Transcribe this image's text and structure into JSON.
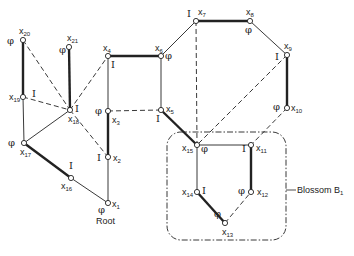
{
  "diagram": {
    "type": "graph-with-blossom",
    "nodes": [
      {
        "id": "x1",
        "label": "x",
        "sub": "1",
        "x": 108,
        "y": 203,
        "mark": "φ",
        "mx": -10,
        "my": 10,
        "lx": 4,
        "ly": 4
      },
      {
        "id": "x2",
        "label": "x",
        "sub": "2",
        "x": 108,
        "y": 157,
        "mark": "I",
        "mx": -11,
        "my": 4,
        "lx": 5,
        "ly": 4
      },
      {
        "id": "x3",
        "label": "x",
        "sub": "3",
        "x": 108,
        "y": 111,
        "mark": "φ",
        "mx": -13,
        "my": 3,
        "lx": 4,
        "ly": 12
      },
      {
        "id": "x4",
        "label": "x",
        "sub": "4",
        "x": 108,
        "y": 56,
        "mark": "I",
        "mx": 3,
        "my": 12,
        "lx": -5,
        "ly": -5
      },
      {
        "id": "x5",
        "label": "x",
        "sub": "5",
        "x": 161,
        "y": 110,
        "mark": "I",
        "mx": -5,
        "my": 12,
        "lx": 5,
        "ly": 2
      },
      {
        "id": "x6",
        "label": "x",
        "sub": "6",
        "x": 161,
        "y": 56,
        "mark": "φ",
        "mx": 4,
        "my": 3,
        "lx": -6,
        "ly": -5
      },
      {
        "id": "x7",
        "label": "x",
        "sub": "7",
        "x": 196,
        "y": 21,
        "mark": "I",
        "mx": -9,
        "my": -4,
        "lx": 2,
        "ly": -6
      },
      {
        "id": "x8",
        "label": "x",
        "sub": "8",
        "x": 250,
        "y": 21,
        "mark": "φ",
        "mx": -5,
        "my": 12,
        "lx": -4,
        "ly": -6
      },
      {
        "id": "x9",
        "label": "x",
        "sub": "9",
        "x": 287,
        "y": 55,
        "mark": "I",
        "mx": -12,
        "my": 5,
        "lx": -3,
        "ly": -6
      },
      {
        "id": "x10",
        "label": "x",
        "sub": "10",
        "x": 287,
        "y": 108,
        "mark": "φ",
        "mx": -14,
        "my": 2,
        "lx": 4,
        "ly": 3
      },
      {
        "id": "x11",
        "label": "x",
        "sub": "11",
        "x": 251,
        "y": 145,
        "mark": "I",
        "mx": -9,
        "my": 7,
        "lx": 5,
        "ly": 6
      },
      {
        "id": "x12",
        "label": "x",
        "sub": "12",
        "x": 251,
        "y": 192,
        "mark": "φ",
        "mx": -13,
        "my": 2,
        "lx": 6,
        "ly": 3
      },
      {
        "id": "x13",
        "label": "x",
        "sub": "13",
        "x": 225,
        "y": 223,
        "mark": "φ",
        "mx": -11,
        "my": -6,
        "lx": -3,
        "ly": 12
      },
      {
        "id": "x14",
        "label": "x",
        "sub": "14",
        "x": 197,
        "y": 192,
        "mark": "I",
        "mx": 5,
        "my": 2,
        "lx": -15,
        "ly": 3
      },
      {
        "id": "x15",
        "label": "x",
        "sub": "15",
        "x": 197,
        "y": 145,
        "mark": "φ",
        "mx": 4,
        "my": 7,
        "lx": -15,
        "ly": 6
      },
      {
        "id": "x16",
        "label": "x",
        "sub": "16",
        "x": 71,
        "y": 178,
        "mark": "I",
        "mx": -2,
        "my": -9,
        "lx": -10,
        "ly": 11
      },
      {
        "id": "x17",
        "label": "x",
        "sub": "17",
        "x": 24,
        "y": 143,
        "mark": "φ",
        "mx": -16,
        "my": 3,
        "lx": -4,
        "ly": 12
      },
      {
        "id": "x18",
        "label": "x",
        "sub": "18",
        "x": 70,
        "y": 110,
        "mark": "I",
        "mx": 5,
        "my": 2,
        "lx": -2,
        "ly": 12
      },
      {
        "id": "x19",
        "label": "x",
        "sub": "19",
        "x": 23,
        "y": 97,
        "mark": "I",
        "mx": 9,
        "my": 0,
        "lx": -14,
        "ly": 3
      },
      {
        "id": "x20",
        "label": "x",
        "sub": "20",
        "x": 23,
        "y": 40,
        "mark": "φ",
        "mx": -16,
        "my": 4,
        "lx": -4,
        "ly": -6
      },
      {
        "id": "x21",
        "label": "x",
        "sub": "21",
        "x": 69,
        "y": 47,
        "mark": "φ",
        "mx": -10,
        "my": 6,
        "lx": -2,
        "ly": -6
      }
    ],
    "edges": [
      {
        "a": "x1",
        "b": "x2",
        "style": "thin"
      },
      {
        "a": "x2",
        "b": "x3",
        "style": "thick"
      },
      {
        "a": "x3",
        "b": "x4",
        "style": "thin"
      },
      {
        "a": "x4",
        "b": "x6",
        "style": "thick"
      },
      {
        "a": "x6",
        "b": "x5",
        "style": "thin"
      },
      {
        "a": "x3",
        "b": "x5",
        "style": "dashed"
      },
      {
        "a": "x6",
        "b": "x7",
        "style": "thin"
      },
      {
        "a": "x7",
        "b": "x8",
        "style": "thick"
      },
      {
        "a": "x8",
        "b": "x9",
        "style": "thin"
      },
      {
        "a": "x9",
        "b": "x10",
        "style": "thick"
      },
      {
        "a": "x5",
        "b": "x15",
        "style": "thick"
      },
      {
        "a": "x7",
        "b": "x15",
        "style": "dashed"
      },
      {
        "a": "x9",
        "b": "x15",
        "style": "dashed"
      },
      {
        "a": "x10",
        "b": "x11",
        "style": "dashed"
      },
      {
        "a": "x15",
        "b": "x11",
        "style": "thin"
      },
      {
        "a": "x11",
        "b": "x12",
        "style": "thick"
      },
      {
        "a": "x15",
        "b": "x14",
        "style": "thin"
      },
      {
        "a": "x14",
        "b": "x13",
        "style": "thick"
      },
      {
        "a": "x13",
        "b": "x12",
        "style": "dashed"
      },
      {
        "a": "x1",
        "b": "x16",
        "style": "thin"
      },
      {
        "a": "x16",
        "b": "x17",
        "style": "thick"
      },
      {
        "a": "x17",
        "b": "x19",
        "style": "thin"
      },
      {
        "a": "x19",
        "b": "x20",
        "style": "thick"
      },
      {
        "a": "x17",
        "b": "x18",
        "style": "thin"
      },
      {
        "a": "x18",
        "b": "x21",
        "style": "thick"
      },
      {
        "a": "x20",
        "b": "x18",
        "style": "dashed"
      },
      {
        "a": "x19",
        "b": "x18",
        "style": "dashed"
      },
      {
        "a": "x18",
        "b": "x4",
        "style": "dashed"
      },
      {
        "a": "x18",
        "b": "x2",
        "style": "dashed"
      }
    ],
    "root_label": "Root",
    "blossom": {
      "label": "Blossom B",
      "sub": "1",
      "x": 167,
      "y": 132,
      "w": 119,
      "h": 108
    },
    "colors": {
      "ink": "#222222",
      "background": "#ffffff"
    }
  }
}
